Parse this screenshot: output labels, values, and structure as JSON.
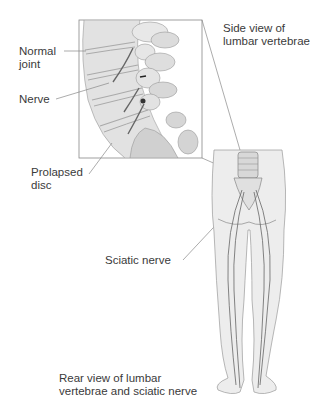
{
  "labels": {
    "normal_joint": "Normal\njoint",
    "nerve": "Nerve",
    "prolapsed_disc": "Prolapsed\ndisc",
    "side_view": "Side view of\nlumbar vertebrae",
    "sciatic_nerve": "Sciatic nerve",
    "rear_view": "Rear view of lumbar\nvertebrae and sciatic nerve"
  },
  "colors": {
    "line": "#777777",
    "bone_fill": "#e4e4e4",
    "bone_shade": "#bdbdbd",
    "body_fill": "#eeeeee",
    "outline": "#888888",
    "nerve": "#555555"
  }
}
